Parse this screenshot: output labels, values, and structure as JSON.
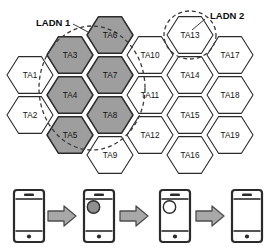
{
  "figure": {
    "type": "hexagonal-cell-coverage-diagram"
  },
  "colors": {
    "hex_fill_plain": "#ffffff",
    "hex_fill_shaded": "#9e9e9e",
    "hex_stroke": "#2b2b2b",
    "ladn_dash_stroke": "#3a3a3a",
    "arrow_fill": "#a8a8a8",
    "arrow_stroke": "#4d4d4d",
    "phone_stroke": "#2b2b2b",
    "phone_dot_fill": "#2b2b2b",
    "phone_circle_filled": "#8f8f8f",
    "phone_circle_empty": "#ffffff",
    "text": "#111111"
  },
  "ladn_areas": [
    {
      "id": "ladn-1",
      "label": "LADN 1",
      "label_x": 36,
      "label_y": 23,
      "cells": [
        "TA3",
        "TA4",
        "TA6",
        "TA7",
        "TA8",
        "TA5"
      ]
    },
    {
      "id": "ladn-2",
      "label": "LADN 2",
      "label_x": 210,
      "label_y": 16,
      "cells": [
        "TA13"
      ]
    }
  ],
  "grid": {
    "hex_radius": 23,
    "columns": [
      {
        "cx": 30,
        "cells": [
          {
            "label": "TA1",
            "cy": 75
          },
          {
            "label": "TA2",
            "cy": 115
          }
        ]
      },
      {
        "cx": 70,
        "cells": [
          {
            "label": "TA3",
            "cy": 55,
            "shaded": true
          },
          {
            "label": "TA4",
            "cy": 95,
            "shaded": true
          },
          {
            "label": "TA5",
            "cy": 135,
            "shaded": true
          }
        ]
      },
      {
        "cx": 110,
        "cells": [
          {
            "label": "TA6",
            "cy": 35,
            "shaded": true
          },
          {
            "label": "TA7",
            "cy": 75,
            "shaded": true
          },
          {
            "label": "TA8",
            "cy": 115,
            "shaded": true
          },
          {
            "label": "TA9",
            "cy": 155
          }
        ]
      },
      {
        "cx": 150,
        "cells": [
          {
            "label": "TA10",
            "cy": 55
          },
          {
            "label": "TA11",
            "cy": 95
          },
          {
            "label": "TA12",
            "cy": 135
          }
        ]
      },
      {
        "cx": 190,
        "cells": [
          {
            "label": "TA13",
            "cy": 35,
            "ladn": "ladn-2"
          },
          {
            "label": "TA14",
            "cy": 75
          },
          {
            "label": "TA15",
            "cy": 115
          },
          {
            "label": "TA16",
            "cy": 155
          }
        ]
      },
      {
        "cx": 230,
        "cells": [
          {
            "label": "TA17",
            "cy": 55
          },
          {
            "label": "TA18",
            "cy": 95
          },
          {
            "label": "TA19",
            "cy": 135
          }
        ]
      }
    ]
  },
  "lifecycle": {
    "phones": [
      {
        "id": "phone-1",
        "x": 14,
        "indicator": "none"
      },
      {
        "id": "phone-2",
        "x": 84,
        "indicator": "filled"
      },
      {
        "id": "phone-3",
        "x": 160,
        "indicator": "empty"
      },
      {
        "id": "phone-4",
        "x": 232,
        "indicator": "none"
      }
    ],
    "arrows": [
      {
        "id": "arrow-1",
        "x": 48
      },
      {
        "id": "arrow-2",
        "x": 120
      },
      {
        "id": "arrow-3",
        "x": 196
      }
    ]
  }
}
